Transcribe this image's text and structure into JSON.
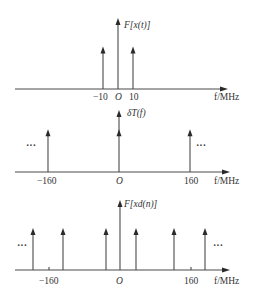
{
  "figure": {
    "unit_label": "f/MHz",
    "panels": [
      {
        "name": "spectrum-x",
        "title": "F[x(t)]",
        "ellipsis": false,
        "impulses": [
          {
            "f": -10,
            "height": 0.7
          },
          {
            "f": 0,
            "height": 1.0
          },
          {
            "f": 10,
            "height": 0.7
          }
        ],
        "ticks": [
          {
            "f": -10,
            "label": "−10"
          },
          {
            "f": 0,
            "label": "O"
          },
          {
            "f": 10,
            "label": "10"
          }
        ],
        "f_range": [
          -165,
          165
        ]
      },
      {
        "name": "impulse-train",
        "title": "δT(f)",
        "ellipsis": true,
        "impulses": [
          {
            "f": -160,
            "height": 0.7
          },
          {
            "f": 0,
            "height": 1.0
          },
          {
            "f": 160,
            "height": 0.7
          }
        ],
        "ticks": [
          {
            "f": -160,
            "label": "−160"
          },
          {
            "f": 0,
            "label": "O"
          },
          {
            "f": 160,
            "label": "160"
          }
        ],
        "f_range": [
          -200,
          200
        ]
      },
      {
        "name": "spectrum-sampled",
        "title": "F[xd(n)]",
        "ellipsis": true,
        "impulses": [
          {
            "f": -170,
            "height": 0.7
          },
          {
            "f": -150,
            "height": 0.7
          },
          {
            "f": -10,
            "height": 0.7
          },
          {
            "f": 0,
            "height": 1.0
          },
          {
            "f": 10,
            "height": 0.7
          },
          {
            "f": 150,
            "height": 0.7
          },
          {
            "f": 170,
            "height": 0.7
          }
        ],
        "ticks": [
          {
            "f": -160,
            "label": "−160"
          },
          {
            "f": 0,
            "label": "O"
          },
          {
            "f": 160,
            "label": "160"
          }
        ],
        "f_range": [
          -200,
          200
        ]
      }
    ]
  }
}
